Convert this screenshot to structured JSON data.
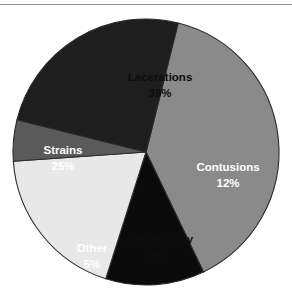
{
  "figure": {
    "background_color": "#ffffff",
    "rule_color": "#8f8f8f",
    "outline_color": "#2b2b2b"
  },
  "chart_data": {
    "type": "pie",
    "title": "",
    "subtitle": "",
    "xlabel": "",
    "ylabel": "",
    "grid": false,
    "legend": "none",
    "labels_inside_slices": true,
    "value_unit": "%",
    "center": {
      "x": 146,
      "y": 152
    },
    "radius": 133,
    "start_angle_deg": 14,
    "direction": "clockwise",
    "categories": [
      "Lacerations",
      "Contusions",
      "Foreign Body",
      "Other",
      "Strains"
    ],
    "values": [
      39,
      12,
      19,
      5,
      25
    ],
    "slices": [
      {
        "name": "Lacerations",
        "value": 39,
        "value_label": "39%",
        "fill": "#8a8a8a",
        "text_color": "#0d0d0d",
        "label_x": 160,
        "label_y": 78
      },
      {
        "name": "Contusions",
        "value": 12,
        "value_label": "12%",
        "fill": "#0a0a0a",
        "text_color": "#ffffff",
        "label_x": 228,
        "label_y": 168
      },
      {
        "name": "Foreign Body",
        "value": 19,
        "value_label": "19%",
        "fill": "#e8e8e8",
        "text_color": "#0d0d0d",
        "label_x": 156,
        "label_y": 240
      },
      {
        "name": "Other",
        "value": 5,
        "value_label": "5%",
        "fill": "#5a5a5a",
        "text_color": "#ffffff",
        "label_x": 92,
        "label_y": 249
      },
      {
        "name": "Strains",
        "value": 25,
        "value_label": "25%",
        "fill": "#1e1e1e",
        "text_color": "#ffffff",
        "label_x": 63,
        "label_y": 151
      }
    ]
  }
}
